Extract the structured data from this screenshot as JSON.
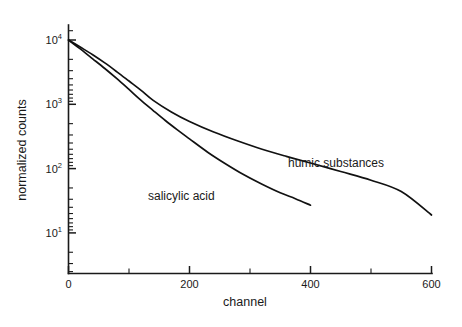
{
  "chart_data": {
    "type": "line",
    "title": "",
    "xlabel": "channel",
    "ylabel": "normalized counts",
    "xlim": [
      0,
      600
    ],
    "ylim": [
      10,
      10000
    ],
    "yscale": "log",
    "xscale": "linear",
    "grid": false,
    "legend_position": "inline-annotations",
    "x_ticks": [
      0,
      200,
      400,
      600
    ],
    "x_tick_labels": [
      "0",
      "200",
      "400",
      "600"
    ],
    "x_minor_ticks": [
      100,
      300,
      500
    ],
    "y_ticks": [
      10,
      100,
      1000,
      10000
    ],
    "y_tick_labels": [
      "10",
      "10",
      "10",
      "10"
    ],
    "y_tick_exponents": [
      "1",
      "2",
      "3",
      "4"
    ],
    "series": [
      {
        "name": "salicylic acid",
        "label": "salicylic acid",
        "label_x": 210,
        "label_y": 60,
        "x": [
          0,
          20,
          40,
          60,
          80,
          100,
          120,
          140,
          160,
          180,
          200,
          230,
          260,
          290,
          320,
          350,
          375,
          400
        ],
        "values": [
          10000,
          7200,
          5100,
          3600,
          2500,
          1700,
          1150,
          800,
          560,
          400,
          290,
          180,
          118,
          80,
          57,
          42,
          34,
          27
        ]
      },
      {
        "name": "humic substances",
        "label": "humic substances",
        "label_x": 420,
        "label_y": 150,
        "x": [
          0,
          20,
          40,
          60,
          80,
          100,
          120,
          140,
          170,
          200,
          240,
          280,
          320,
          360,
          400,
          450,
          500,
          550,
          600
        ],
        "values": [
          10000,
          7700,
          5900,
          4400,
          3200,
          2300,
          1650,
          1150,
          760,
          540,
          370,
          268,
          200,
          155,
          122,
          90,
          66,
          44,
          19
        ]
      }
    ],
    "annotations": [
      {
        "text": "salicylic acid",
        "x_px": 148,
        "y_px": 200
      },
      {
        "text": "humic substances",
        "x_px": 288,
        "y_px": 167
      }
    ]
  },
  "axes": {
    "x_title": "channel",
    "y_title": "normalized counts",
    "x_tick_0": "0",
    "x_tick_200": "200",
    "x_tick_400": "400",
    "x_tick_600": "600",
    "y_base": "10",
    "y_exp_1": "1",
    "y_exp_2": "2",
    "y_exp_3": "3",
    "y_exp_4": "4"
  },
  "curve_labels": {
    "salicylic": "salicylic acid",
    "humic": "humic substances"
  }
}
